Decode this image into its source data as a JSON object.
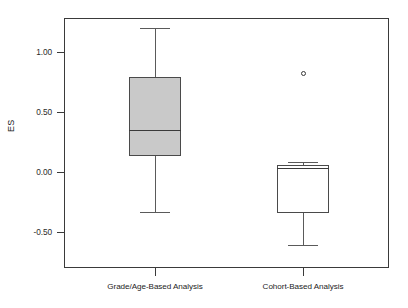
{
  "chart_data": {
    "type": "box",
    "title": "",
    "xlabel": "",
    "ylabel": "ES",
    "ylim": [
      -0.8,
      1.38
    ],
    "grid": false,
    "legend": "none",
    "y_ticks": [
      {
        "label": "1.00",
        "value": 1.0
      },
      {
        "label": "0.50",
        "value": 0.5
      },
      {
        "label": "0.00",
        "value": 0.0
      },
      {
        "label": "-0.50",
        "value": -0.5
      }
    ],
    "categories": [
      "Grade/Age-Based Analysis",
      "Cohort-Based Analysis"
    ],
    "boxes": [
      {
        "category": "Grade/Age-Based Analysis",
        "fill": "#c9c9c9",
        "whisker_low": -0.33,
        "q1": 0.13,
        "median": 0.35,
        "q3": 0.79,
        "whisker_high": 1.2,
        "outliers": []
      },
      {
        "category": "Cohort-Based Analysis",
        "fill": "#ffffff",
        "whisker_low": -0.61,
        "q1": -0.34,
        "median": 0.03,
        "q3": 0.06,
        "whisker_high": 0.08,
        "outliers": [
          0.82
        ]
      }
    ],
    "colors": {
      "axis": "#3a3a3a",
      "box_edge": "#4a4a4a",
      "median": "#3a3a3a",
      "whisker": "#5a5a5a",
      "box_fill_1": "#c9c9c9",
      "box_fill_2": "#ffffff",
      "background": "#ffffff"
    }
  }
}
